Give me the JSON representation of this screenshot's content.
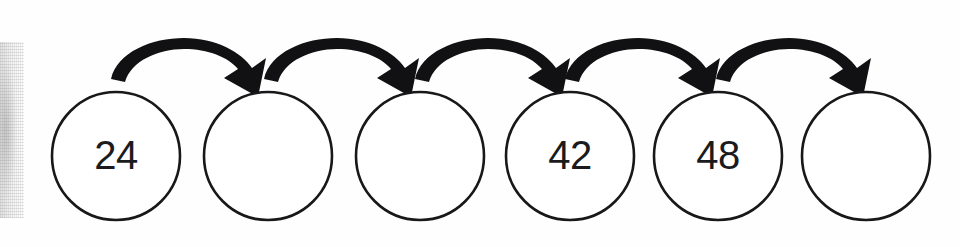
{
  "page": {
    "background_color": "#fefefe",
    "ink_color": "#18181a"
  },
  "diagram": {
    "type": "number-sequence-chain",
    "node_shape": "circle",
    "node_count": 6,
    "arrow_count": 5,
    "arrow_style": "curved-tapered-arrow",
    "arrow_direction": "left-to-right",
    "nodes": [
      {
        "index": 1,
        "value": "24",
        "filled": "true"
      },
      {
        "index": 2,
        "value": "",
        "filled": "false"
      },
      {
        "index": 3,
        "value": "",
        "filled": "false"
      },
      {
        "index": 4,
        "value": "42",
        "filled": "true"
      },
      {
        "index": 5,
        "value": "48",
        "filled": "true"
      },
      {
        "index": 6,
        "value": "",
        "filled": "false"
      }
    ]
  },
  "artifacts": {
    "left_edge_smudge": "scanner-shadow"
  }
}
